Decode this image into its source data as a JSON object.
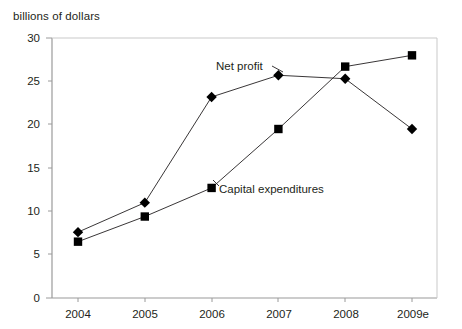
{
  "chart_data": {
    "type": "line",
    "title": "",
    "ylabel": "billions of dollars",
    "xlabel": "",
    "categories": [
      "2004",
      "2005",
      "2006",
      "2007",
      "2008",
      "2009e"
    ],
    "ylim": [
      0,
      30
    ],
    "yticks": [
      0,
      5,
      10,
      15,
      20,
      25,
      30
    ],
    "grid": false,
    "legend_position": "inline-annotation",
    "series": [
      {
        "name": "Net profit",
        "marker": "diamond",
        "values": [
          7.6,
          11.0,
          23.2,
          25.7,
          25.3,
          19.5
        ]
      },
      {
        "name": "Capital expenditures",
        "marker": "square",
        "values": [
          6.5,
          9.4,
          12.7,
          19.5,
          26.7,
          28.0
        ]
      }
    ],
    "annotations": [
      {
        "text": "Net profit",
        "x_value": "2006.6",
        "y_value": 26.6
      },
      {
        "text": "Capital expenditures",
        "x_value": "2006.2",
        "y_value": 12.6
      }
    ],
    "colors": {
      "line": "#231f20",
      "marker": "#000000",
      "axis": "#8c8c8c",
      "text": "#231f20",
      "background": "#ffffff"
    }
  },
  "axis_ticks": {
    "y": [
      "30",
      "25",
      "20",
      "15",
      "10",
      "5",
      "0"
    ],
    "x": [
      "2004",
      "2005",
      "2006",
      "2007",
      "2008",
      "2009e"
    ]
  }
}
